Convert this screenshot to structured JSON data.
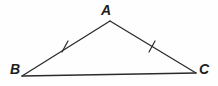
{
  "figure": {
    "name": "isosceles-triangle-abc",
    "width": 218,
    "height": 86,
    "background_color": "#fefefe",
    "stroke_color": "#2b2b2b",
    "stroke_width": 1.3,
    "label_color": "#1d1d1d"
  },
  "vertices": [
    {
      "id": "A",
      "label": "A",
      "x": 110,
      "y": 21,
      "label_x": 101,
      "label_y": 3
    },
    {
      "id": "B",
      "label": "B",
      "x": 22,
      "y": 76,
      "label_x": 10,
      "label_y": 62
    },
    {
      "id": "C",
      "label": "C",
      "x": 196,
      "y": 73,
      "label_x": 199,
      "label_y": 62
    }
  ],
  "sides": [
    {
      "id": "AB",
      "from": "B",
      "to": "A",
      "x1": 22,
      "y1": 76,
      "x2": 110,
      "y2": 21,
      "tick_count": 1
    },
    {
      "id": "AC",
      "from": "A",
      "to": "C",
      "x1": 110,
      "y1": 21,
      "x2": 196,
      "y2": 73,
      "tick_count": 1
    },
    {
      "id": "BC",
      "from": "B",
      "to": "C",
      "x1": 22,
      "y1": 76,
      "x2": 196,
      "y2": 73,
      "tick_count": 0
    }
  ],
  "tick_marks": [
    {
      "id": "tick-ab",
      "on_side": "AB",
      "cx": 65,
      "cy": 47,
      "x1": 62,
      "y1": 52,
      "x2": 68,
      "y2": 41
    },
    {
      "id": "tick-ac",
      "on_side": "AC",
      "cx": 152,
      "cy": 47,
      "x1": 149,
      "y1": 52,
      "x2": 155,
      "y2": 41
    }
  ]
}
